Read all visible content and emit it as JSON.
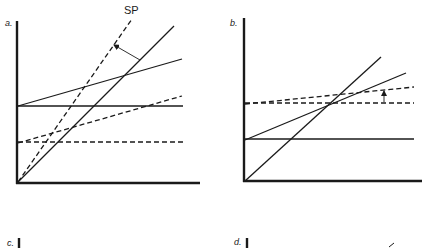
{
  "panels": {
    "a": {
      "label": "a.",
      "annotation": "SP",
      "axes": {
        "x0": 17,
        "y0": 183,
        "y_top": 21,
        "x_right": 200
      },
      "solid_lines": [
        {
          "name": "steep-line",
          "x1": 18,
          "y1": 182,
          "x2": 174,
          "y2": 26
        },
        {
          "name": "horizontal-line",
          "x1": 18,
          "y1": 106,
          "x2": 183,
          "y2": 106
        },
        {
          "name": "sloped-line",
          "x1": 18,
          "y1": 106,
          "x2": 182,
          "y2": 59
        }
      ],
      "dashed_lines": [
        {
          "name": "sp-line",
          "x1": 18,
          "y1": 182,
          "x2": 132,
          "y2": 19
        },
        {
          "name": "dashed-sloped-line",
          "x1": 18,
          "y1": 143,
          "x2": 182,
          "y2": 96
        },
        {
          "name": "dashed-horizontal-line",
          "x1": 18,
          "y1": 142,
          "x2": 183,
          "y2": 142
        }
      ],
      "arrow": {
        "x1": 140,
        "y1": 60,
        "x2": 114,
        "y2": 45
      }
    },
    "b": {
      "label": "b.",
      "axes": {
        "x0": 244,
        "y0": 181,
        "y_top": 18,
        "x_right": 422
      },
      "solid_lines": [
        {
          "name": "steep-line",
          "x1": 245,
          "y1": 181,
          "x2": 381,
          "y2": 57
        },
        {
          "name": "sloped-line",
          "x1": 245,
          "y1": 140,
          "x2": 406,
          "y2": 73
        },
        {
          "name": "horizontal-line",
          "x1": 245,
          "y1": 139,
          "x2": 414,
          "y2": 139
        }
      ],
      "dashed_lines": [
        {
          "name": "dashed-horizontal-line",
          "x1": 245,
          "y1": 103,
          "x2": 414,
          "y2": 103
        },
        {
          "name": "dashed-sloped-line",
          "x1": 245,
          "y1": 104,
          "x2": 414,
          "y2": 87
        }
      ],
      "arrow": {
        "x1": 384,
        "y1": 102,
        "x2": 384,
        "y2": 91
      }
    },
    "c": {
      "label": "c.",
      "axis": {
        "x": 19,
        "y_top": 238,
        "y_bottom": 248
      }
    },
    "d": {
      "label": "d.",
      "axis": {
        "x": 247,
        "y_top": 238,
        "y_bottom": 248
      },
      "mark": {
        "x1": 389,
        "y1": 247,
        "x2": 394,
        "y2": 243
      }
    }
  },
  "colors": {
    "ink": "#1a1a1a",
    "background": "#ffffff"
  }
}
